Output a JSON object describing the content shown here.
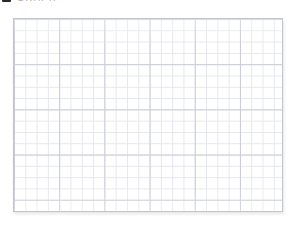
{
  "header": {
    "icon": "app-square-icon",
    "title": "GRAPH",
    "title_clipped": true
  },
  "canvas": {
    "name": "graph-paper-canvas",
    "content": "",
    "state": "empty",
    "grid": {
      "visible": true,
      "minor_spacing_px": 11.3,
      "major_every_n_cells": 4,
      "minor_color": "#e4e7ec",
      "major_color": "#c9ccd4",
      "border_color": "#c2c5cc",
      "background_color": "#ffffff",
      "columns": 24,
      "rows": 17,
      "left_px": 13,
      "top_px": 18,
      "width_px": 270,
      "height_px": 194
    }
  },
  "page": {
    "background_color": "#ffffff"
  }
}
